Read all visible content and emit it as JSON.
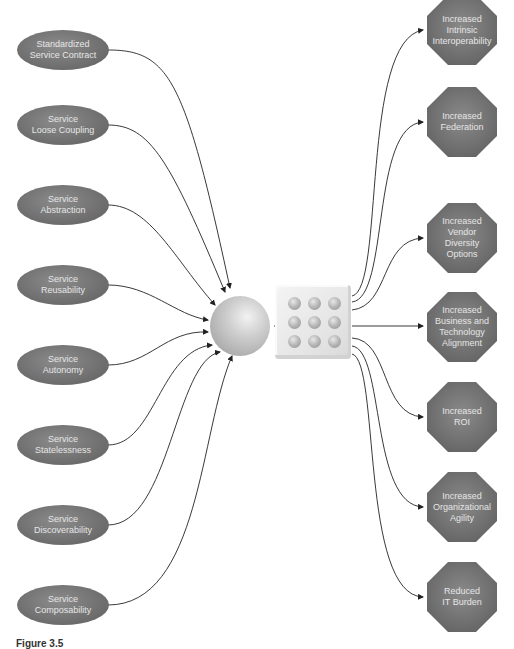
{
  "diagram": {
    "principles": [
      {
        "line1": "Standardized",
        "line2": "Service Contract"
      },
      {
        "line1": "Service",
        "line2": "Loose Coupling"
      },
      {
        "line1": "Service",
        "line2": "Abstraction"
      },
      {
        "line1": "Service",
        "line2": "Reusability"
      },
      {
        "line1": "Service",
        "line2": "Autonomy"
      },
      {
        "line1": "Service",
        "line2": "Statelessness"
      },
      {
        "line1": "Service",
        "line2": "Discoverability"
      },
      {
        "line1": "Service",
        "line2": "Composability"
      }
    ],
    "goals": [
      {
        "lines": [
          "Increased",
          "Intrinsic",
          "Interoperability"
        ]
      },
      {
        "lines": [
          "Increased",
          "Federation"
        ]
      },
      {
        "lines": [
          "Increased",
          "Vendor",
          "Diversity",
          "Options"
        ]
      },
      {
        "lines": [
          "Increased",
          "Business and",
          "Technology",
          "Alignment"
        ]
      },
      {
        "lines": [
          "Increased",
          "ROI"
        ]
      },
      {
        "lines": [
          "Increased",
          "Organizational",
          "Agility"
        ]
      },
      {
        "lines": [
          "Reduced",
          "IT Burden"
        ]
      }
    ],
    "caption": "Figure 3.5",
    "colors": {
      "shape_fill": "#707070",
      "shape_text": "#e6e6e6",
      "connector": "#222222"
    }
  }
}
